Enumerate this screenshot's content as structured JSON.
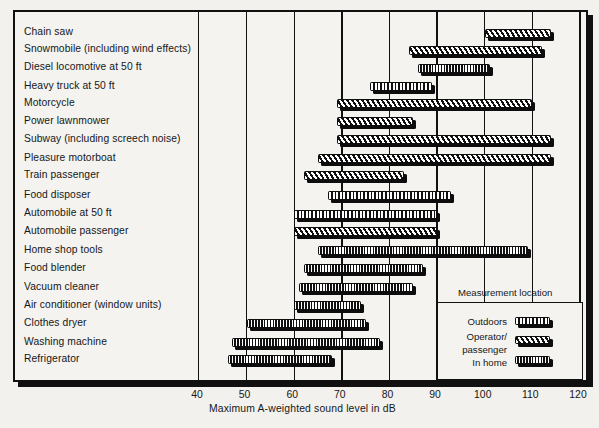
{
  "chart_data": {
    "type": "bar",
    "orientation": "horizontal-range",
    "title": "",
    "xlabel": "Maximum A-weighted sound level in dB",
    "ylabel": "",
    "xlim": [
      40,
      120
    ],
    "xticks": [
      40,
      50,
      60,
      70,
      80,
      90,
      100,
      110,
      120
    ],
    "grid": true,
    "legend": {
      "title": "Measurement location",
      "position": "inside-bottom-right",
      "entries": [
        {
          "label": "Outdoors",
          "pattern": "outdoors"
        },
        {
          "label": "Operator/",
          "pattern": "operator"
        },
        {
          "label": "passenger",
          "pattern": "operator-cont"
        },
        {
          "label": "In home",
          "pattern": "inhome"
        }
      ]
    },
    "categories": [
      "Chain saw",
      "Snowmobile (including wind effects)",
      "Diesel locomotive at 50 ft",
      "Heavy truck at 50 ft",
      "Motorcycle",
      "Power lawnmower",
      "Subway (including screech noise)",
      "Pleasure motorboat",
      "Train passenger",
      "Food disposer",
      "Automobile at 50 ft",
      "Automobile passenger",
      "Home shop tools",
      "Food blender",
      "Vacuum cleaner",
      "Air conditioner (window units)",
      "Clothes dryer",
      "Washing machine",
      "Refrigerator"
    ],
    "bars": [
      {
        "label": "Chain saw",
        "start": 100,
        "end": 114,
        "pattern": "operator"
      },
      {
        "label": "Snowmobile (including wind effects)",
        "start": 84,
        "end": 112,
        "pattern": "operator"
      },
      {
        "label": "Diesel locomotive at 50 ft",
        "start": 86,
        "end": 101,
        "pattern": "inhome"
      },
      {
        "label": "Heavy truck at 50 ft",
        "start": 76,
        "end": 89,
        "pattern": "outdoors"
      },
      {
        "label": "Motorcycle",
        "start": 69,
        "end": 110,
        "pattern": "operator"
      },
      {
        "label": "Power lawnmower",
        "start": 69,
        "end": 85,
        "pattern": "operator"
      },
      {
        "label": "Subway (including screech noise)",
        "start": 69,
        "end": 114,
        "pattern": "operator"
      },
      {
        "label": "Pleasure motorboat",
        "start": 65,
        "end": 114,
        "pattern": "operator"
      },
      {
        "label": "Train passenger",
        "start": 62,
        "end": 83,
        "pattern": "operator"
      },
      {
        "label": "Food disposer",
        "start": 67,
        "end": 93,
        "pattern": "outdoors"
      },
      {
        "label": "Automobile at 50 ft",
        "start": 60,
        "end": 90,
        "pattern": "outdoors"
      },
      {
        "label": "Automobile passenger",
        "start": 60,
        "end": 90,
        "pattern": "operator"
      },
      {
        "label": "Home shop tools",
        "start": 65,
        "end": 109,
        "pattern": "inhome"
      },
      {
        "label": "Food blender",
        "start": 62,
        "end": 87,
        "pattern": "inhome"
      },
      {
        "label": "Vacuum cleaner",
        "start": 61,
        "end": 85,
        "pattern": "inhome"
      },
      {
        "label": "Air conditioner (window units)",
        "start": 60,
        "end": 74,
        "pattern": "inhome"
      },
      {
        "label": "Clothes dryer",
        "start": 50,
        "end": 75,
        "pattern": "inhome"
      },
      {
        "label": "Washing machine",
        "start": 47,
        "end": 78,
        "pattern": "inhome"
      },
      {
        "label": "Refrigerator",
        "start": 46,
        "end": 68,
        "pattern": "inhome"
      }
    ]
  }
}
